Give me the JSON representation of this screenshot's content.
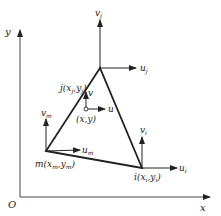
{
  "axes": {
    "origin_label": "O",
    "x_label": "x",
    "y_label": "y"
  },
  "nodes": {
    "i": {
      "name": "i",
      "x": "x",
      "x_sub": "i",
      "y": "y",
      "y_sub": "i",
      "u": "u",
      "u_sub": "i",
      "v": "v",
      "v_sub": "i"
    },
    "j": {
      "name": "j",
      "x": "x",
      "x_sub": "j",
      "y": "y",
      "y_sub": "j",
      "u": "u",
      "u_sub": "j",
      "v": "v",
      "v_sub": "j"
    },
    "m": {
      "name": "m",
      "x": "x",
      "x_sub": "m",
      "y": "y",
      "y_sub": "m",
      "u": "u",
      "u_sub": "m",
      "v": "v",
      "v_sub": "m"
    }
  },
  "interior_point": {
    "label": "(x,y)",
    "u": "u",
    "v": "v"
  },
  "colors": {
    "line": "#222222",
    "axis": "#444444",
    "text": "#222222"
  }
}
